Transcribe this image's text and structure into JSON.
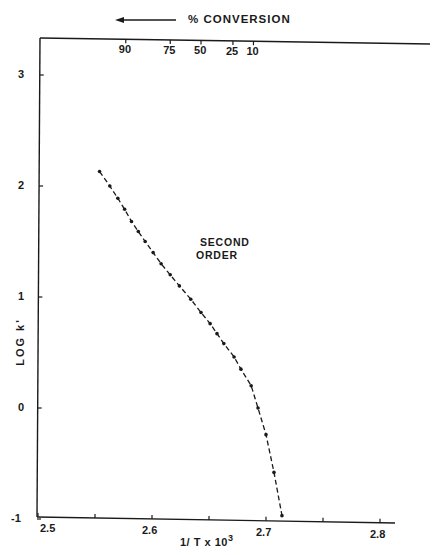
{
  "chart_data": {
    "type": "line",
    "title": "",
    "xlabel": "1/T x 10^3",
    "xlabel_main": "1/ T  x 10",
    "xlabel_exp": "3",
    "ylabel": "LOG k'",
    "xlim": [
      2.5,
      2.8
    ],
    "ylim": [
      -1,
      3.3
    ],
    "x_ticks": [
      "2.5",
      "2.6",
      "2.7",
      "2.8"
    ],
    "y_ticks": [
      "-1",
      "0",
      "1",
      "2",
      "3"
    ],
    "grid": false,
    "top_axis": {
      "label": "% CONVERSION",
      "arrow": "left",
      "ticks": [
        {
          "label": "90",
          "x": 2.577
        },
        {
          "label": "75",
          "x": 2.616
        },
        {
          "label": "50",
          "x": 2.643
        },
        {
          "label": "25",
          "x": 2.671
        },
        {
          "label": "10",
          "x": 2.689
        }
      ]
    },
    "annotation": {
      "text_line1": "SECOND",
      "text_line2": "ORDER",
      "x": 2.635,
      "y": 1.55
    },
    "series": [
      {
        "name": "Second order",
        "style": "dash-dot with points",
        "x": [
          2.554,
          2.563,
          2.57,
          2.576,
          2.582,
          2.588,
          2.594,
          2.601,
          2.608,
          2.616,
          2.624,
          2.634,
          2.643,
          2.651,
          2.657,
          2.663,
          2.672,
          2.678,
          2.687,
          2.693,
          2.7,
          2.707,
          2.714
        ],
        "y": [
          2.13,
          2.0,
          1.89,
          1.79,
          1.68,
          1.59,
          1.5,
          1.4,
          1.3,
          1.2,
          1.1,
          0.98,
          0.86,
          0.76,
          0.67,
          0.58,
          0.46,
          0.35,
          0.2,
          0.0,
          -0.24,
          -0.58,
          -0.97
        ]
      }
    ]
  }
}
